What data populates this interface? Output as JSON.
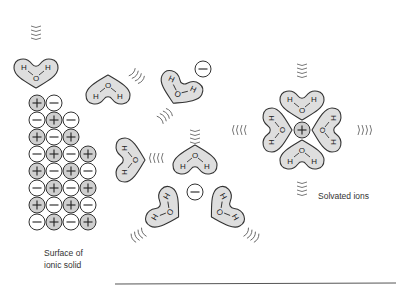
{
  "labels": {
    "surface_line1": "Surface of",
    "surface_line2": "ionic solid",
    "solvated": "Solvated ions"
  },
  "molecule": {
    "oxygen": "O",
    "hydrogen": "H",
    "formula": "H2O"
  },
  "ionic_solid_grid": [
    [
      "+",
      "-"
    ],
    [
      "-",
      "+",
      "-"
    ],
    [
      "+",
      "-",
      "+"
    ],
    [
      "-",
      "+",
      "-",
      "+"
    ],
    [
      "+",
      "-",
      "+",
      "-"
    ],
    [
      "-",
      "+",
      "-",
      "+"
    ],
    [
      "+",
      "-",
      "+",
      "-"
    ],
    [
      "-",
      "+",
      "-",
      "+"
    ]
  ],
  "solvated_anion": {
    "charge": "-",
    "water_count": 3
  },
  "solvated_cation": {
    "charge": "+",
    "water_count": 4
  },
  "free_anion": {
    "charge": "-"
  },
  "colors": {
    "cation_fill": "#cfcfcf",
    "anion_fill": "#ffffff",
    "molecule_fill": "#dedede",
    "outline": "#333333"
  }
}
